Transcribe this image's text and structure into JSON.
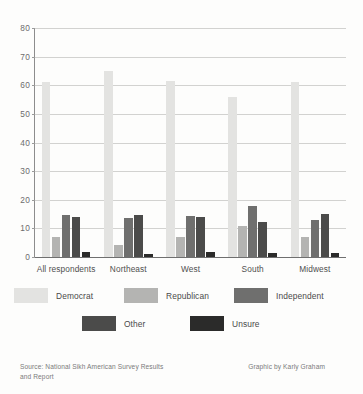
{
  "chart_data": {
    "type": "bar",
    "title": "",
    "xlabel": "",
    "ylabel": "",
    "ylim": [
      0,
      80
    ],
    "yticks": [
      0,
      10,
      20,
      30,
      40,
      50,
      60,
      70,
      80
    ],
    "grid": true,
    "legend_position": "bottom",
    "categories": [
      "All respondents",
      "Northeast",
      "West",
      "South",
      "Midwest"
    ],
    "series": [
      {
        "name": "Democrat",
        "color": "#e3e3e1",
        "values": [
          61,
          65,
          61.5,
          56,
          61
        ]
      },
      {
        "name": "Republican",
        "color": "#b4b4b2",
        "values": [
          7,
          4.3,
          7,
          10.8,
          7
        ]
      },
      {
        "name": "Independent",
        "color": "#6f6f6e",
        "values": [
          14.8,
          13.8,
          14.3,
          17.9,
          13
        ]
      },
      {
        "name": "Other",
        "color": "#4b4b4a",
        "values": [
          14,
          14.6,
          13.9,
          12.2,
          15.2
        ]
      },
      {
        "name": "Unsure",
        "color": "#2b2b2a",
        "values": [
          1.6,
          1.2,
          1.7,
          1.5,
          1.5
        ]
      }
    ]
  },
  "footer": {
    "source": "Source: National Sikh American Survey Results and Report",
    "credit": "Graphic by Karly Graham"
  }
}
